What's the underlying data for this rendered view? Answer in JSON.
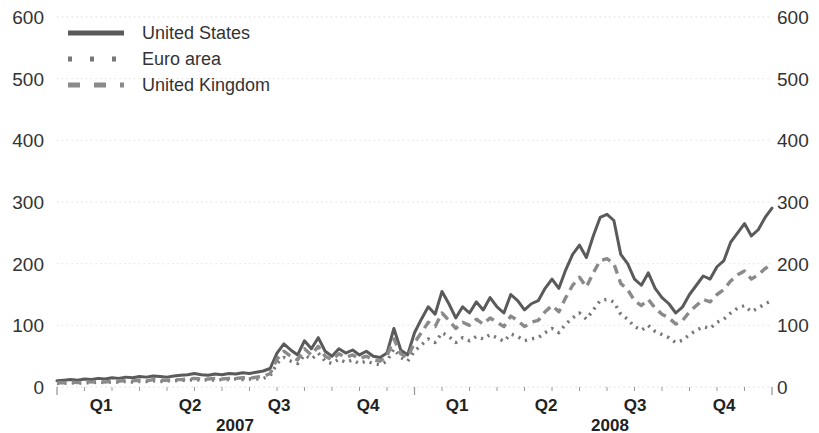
{
  "chart_data": {
    "type": "line",
    "title": "",
    "subtitle": "",
    "xlabel": "",
    "ylabel": "",
    "ylim": [
      0,
      600
    ],
    "y_ticks": [
      0,
      100,
      200,
      300,
      400,
      500,
      600
    ],
    "y_ticks_right": [
      0,
      100,
      200,
      300,
      400,
      500,
      600
    ],
    "grid": true,
    "grid_style": "dotted",
    "legend_position": "top-left",
    "x_tick_labels": [
      "Q1",
      "Q2",
      "Q3",
      "Q4",
      "Q1",
      "Q2",
      "Q3",
      "Q4"
    ],
    "x_group_labels": [
      "2007",
      "2008"
    ],
    "x_axis_domain": [
      0,
      104
    ],
    "x_unit": "weeks",
    "series": [
      {
        "name": "United States",
        "style": "solid",
        "color": "#5a5a5a",
        "x": [
          0,
          1,
          2,
          3,
          4,
          5,
          6,
          7,
          8,
          9,
          10,
          11,
          12,
          13,
          14,
          15,
          16,
          17,
          18,
          19,
          20,
          21,
          22,
          23,
          24,
          25,
          26,
          27,
          28,
          29,
          30,
          31,
          32,
          33,
          34,
          35,
          36,
          37,
          38,
          39,
          40,
          41,
          42,
          43,
          44,
          45,
          46,
          47,
          48,
          49,
          50,
          51,
          52,
          53,
          54,
          55,
          56,
          57,
          58,
          59,
          60,
          61,
          62,
          63,
          64,
          65,
          66,
          67,
          68,
          69,
          70,
          71,
          72,
          73,
          74,
          75,
          76,
          77,
          78,
          79,
          80,
          81,
          82,
          83,
          84,
          85,
          86,
          87,
          88,
          89,
          90,
          91,
          92,
          93,
          94,
          95,
          96,
          97,
          98,
          99,
          100,
          101,
          102,
          103,
          104
        ],
        "values": [
          10,
          11,
          12,
          11,
          13,
          12,
          14,
          13,
          15,
          14,
          16,
          15,
          17,
          16,
          18,
          17,
          16,
          18,
          19,
          20,
          22,
          20,
          19,
          21,
          20,
          22,
          21,
          23,
          22,
          24,
          26,
          30,
          55,
          70,
          60,
          52,
          75,
          62,
          80,
          58,
          50,
          62,
          55,
          60,
          52,
          58,
          50,
          48,
          55,
          95,
          60,
          52,
          88,
          110,
          130,
          118,
          155,
          135,
          112,
          130,
          120,
          138,
          125,
          145,
          130,
          120,
          150,
          140,
          125,
          135,
          140,
          160,
          175,
          160,
          190,
          215,
          230,
          210,
          245,
          275,
          280,
          270,
          215,
          200,
          175,
          165,
          185,
          160,
          145,
          135,
          120,
          130,
          150,
          165,
          180,
          175,
          195,
          205,
          235,
          250,
          265,
          245,
          255,
          275,
          290
        ],
        "units": "basis points"
      },
      {
        "name": "Euro area",
        "style": "dotted",
        "color": "#777777",
        "x": [
          0,
          1,
          2,
          3,
          4,
          5,
          6,
          7,
          8,
          9,
          10,
          11,
          12,
          13,
          14,
          15,
          16,
          17,
          18,
          19,
          20,
          21,
          22,
          23,
          24,
          25,
          26,
          27,
          28,
          29,
          30,
          31,
          32,
          33,
          34,
          35,
          36,
          37,
          38,
          39,
          40,
          41,
          42,
          43,
          44,
          45,
          46,
          47,
          48,
          49,
          50,
          51,
          52,
          53,
          54,
          55,
          56,
          57,
          58,
          59,
          60,
          61,
          62,
          63,
          64,
          65,
          66,
          67,
          68,
          69,
          70,
          71,
          72,
          73,
          74,
          75,
          76,
          77,
          78,
          79,
          80,
          81,
          82,
          83,
          84,
          85,
          86,
          87,
          88,
          89,
          90,
          91,
          92,
          93,
          94,
          95,
          96,
          97,
          98,
          99,
          100,
          101,
          102,
          103,
          104
        ],
        "values": [
          6,
          6,
          7,
          6,
          7,
          7,
          8,
          7,
          8,
          8,
          9,
          8,
          9,
          9,
          10,
          9,
          10,
          10,
          11,
          11,
          12,
          11,
          12,
          11,
          12,
          12,
          13,
          12,
          13,
          13,
          14,
          18,
          38,
          48,
          42,
          38,
          52,
          45,
          55,
          42,
          38,
          45,
          40,
          44,
          38,
          42,
          38,
          36,
          42,
          62,
          48,
          42,
          58,
          68,
          78,
          72,
          88,
          82,
          72,
          80,
          75,
          82,
          78,
          85,
          80,
          74,
          86,
          82,
          75,
          78,
          80,
          88,
          95,
          88,
          102,
          112,
          120,
          110,
          125,
          140,
          142,
          138,
          118,
          110,
          98,
          92,
          100,
          90,
          85,
          80,
          72,
          76,
          85,
          92,
          98,
          95,
          105,
          110,
          120,
          128,
          132,
          122,
          128,
          135,
          140
        ],
        "units": "basis points"
      },
      {
        "name": "United Kingdom",
        "style": "dashed",
        "color": "#8a8a8a",
        "x": [
          0,
          1,
          2,
          3,
          4,
          5,
          6,
          7,
          8,
          9,
          10,
          11,
          12,
          13,
          14,
          15,
          16,
          17,
          18,
          19,
          20,
          21,
          22,
          23,
          24,
          25,
          26,
          27,
          28,
          29,
          30,
          31,
          32,
          33,
          34,
          35,
          36,
          37,
          38,
          39,
          40,
          41,
          42,
          43,
          44,
          45,
          46,
          47,
          48,
          49,
          50,
          51,
          52,
          53,
          54,
          55,
          56,
          57,
          58,
          59,
          60,
          61,
          62,
          63,
          64,
          65,
          66,
          67,
          68,
          69,
          70,
          71,
          72,
          73,
          74,
          75,
          76,
          77,
          78,
          79,
          80,
          81,
          82,
          83,
          84,
          85,
          86,
          87,
          88,
          89,
          90,
          91,
          92,
          93,
          94,
          95,
          96,
          97,
          98,
          99,
          100,
          101,
          102,
          103,
          104
        ],
        "values": [
          7,
          7,
          8,
          7,
          9,
          8,
          9,
          8,
          10,
          9,
          11,
          10,
          11,
          10,
          12,
          11,
          11,
          12,
          12,
          13,
          14,
          13,
          13,
          14,
          13,
          14,
          14,
          15,
          14,
          16,
          17,
          22,
          45,
          58,
          50,
          44,
          62,
          52,
          66,
          50,
          44,
          54,
          48,
          52,
          46,
          50,
          44,
          42,
          50,
          78,
          54,
          48,
          72,
          88,
          105,
          98,
          120,
          108,
          95,
          105,
          100,
          110,
          102,
          112,
          105,
          98,
          115,
          108,
          98,
          105,
          108,
          122,
          132,
          122,
          145,
          165,
          178,
          162,
          185,
          205,
          208,
          200,
          168,
          158,
          140,
          132,
          142,
          128,
          118,
          112,
          102,
          108,
          122,
          132,
          142,
          138,
          150,
          158,
          172,
          182,
          188,
          175,
          182,
          192,
          200
        ],
        "units": "basis points"
      }
    ]
  },
  "legend": {
    "items": [
      {
        "label": "United States",
        "style": "solid"
      },
      {
        "label": "Euro area",
        "style": "dotted"
      },
      {
        "label": "United Kingdom",
        "style": "dashed"
      }
    ]
  },
  "axes": {
    "left_ticks": [
      "600",
      "500",
      "400",
      "300",
      "200",
      "100",
      "0"
    ],
    "right_ticks": [
      "600",
      "500",
      "400",
      "300",
      "200",
      "100",
      "0"
    ],
    "bottom_ticks": [
      "Q1",
      "Q2",
      "Q3",
      "Q4",
      "Q1",
      "Q2",
      "Q3",
      "Q4"
    ],
    "year_groups": [
      "2007",
      "2008"
    ]
  },
  "colors": {
    "us_line": "#5a5a5a",
    "euro_line": "#777777",
    "uk_line": "#8a8a8a",
    "grid": "#e8e8e8",
    "axis_text": "#333333"
  }
}
